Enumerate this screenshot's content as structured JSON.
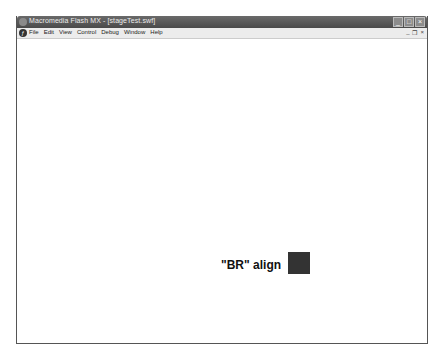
{
  "window": {
    "title": "Macromedia Flash MX - [stageTest.swf]",
    "controls": [
      "minimize",
      "maximize",
      "close"
    ]
  },
  "menubar": {
    "items": [
      "File",
      "Edit",
      "View",
      "Control",
      "Debug",
      "Window",
      "Help"
    ],
    "mdi_controls": [
      "_",
      "❐",
      "×"
    ]
  },
  "stage": {
    "label": "\"BR\" align",
    "square_color": "#333333"
  }
}
